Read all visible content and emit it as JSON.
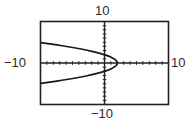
{
  "chart_data": {
    "type": "line",
    "title": "",
    "xlabel": "",
    "ylabel": "",
    "xlim": [
      -10,
      10
    ],
    "ylim": [
      -10,
      10
    ],
    "xscale_tick": 1,
    "yscale_tick": 1,
    "grid": false,
    "window_labels": {
      "ymax": "10",
      "ymin": "−10",
      "xmin": "−10",
      "xmax": "10"
    },
    "series": [
      {
        "name": "sideways parabola (opens left), approx y^2 = 2(2 - x)",
        "vertex": [
          2,
          0
        ],
        "points_upper": [
          [
            -10,
            4.9
          ],
          [
            -8,
            4.47
          ],
          [
            -6,
            4.0
          ],
          [
            -4,
            3.46
          ],
          [
            -2,
            2.83
          ],
          [
            0,
            2.0
          ],
          [
            1,
            1.41
          ],
          [
            2,
            0
          ]
        ],
        "points_lower": [
          [
            -10,
            -4.9
          ],
          [
            -8,
            -4.47
          ],
          [
            -6,
            -4.0
          ],
          [
            -4,
            -3.46
          ],
          [
            -2,
            -2.83
          ],
          [
            0,
            -2.0
          ],
          [
            1,
            -1.41
          ],
          [
            2,
            0
          ]
        ]
      }
    ]
  },
  "labels": {
    "top": "10",
    "bottom": "−10",
    "left": "−10",
    "right": "10"
  },
  "style": {
    "frame_color": "#222222",
    "curve_color": "#1a1a1a",
    "axis_color": "#222222"
  }
}
